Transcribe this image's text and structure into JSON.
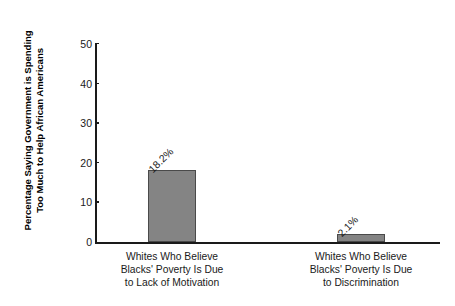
{
  "chart_data": {
    "type": "bar",
    "title": "",
    "xlabel": "",
    "ylabel": "Percentage Saying Government is Spending\nToo Much to Help African Americans",
    "categories": [
      "Whites Who Believe\nBlacks' Poverty Is Due\nto Lack of Motivation",
      "Whites Who Believe\nBlacks' Poverty Is Due\nto Discrimination"
    ],
    "values": [
      18.2,
      2.1
    ],
    "data_labels": [
      "18.2%",
      "2.1%"
    ],
    "ylim": [
      0,
      50
    ],
    "yticks": [
      0,
      10,
      20,
      30,
      40,
      50
    ],
    "ytick_labels": [
      "0",
      "10",
      "20",
      "30",
      "40",
      "50"
    ],
    "grid": false,
    "legend": false,
    "bar_color": "#848484",
    "bar_edge_color": "#4a4a4a",
    "axis_color": "#1a1a1a",
    "background": "#ffffff"
  }
}
